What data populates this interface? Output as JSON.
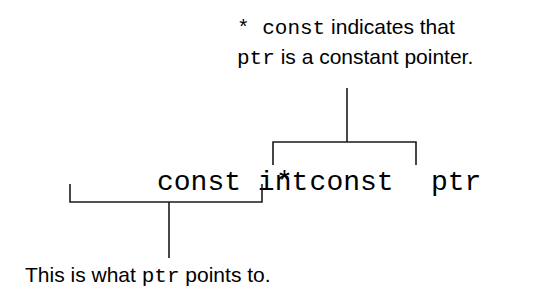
{
  "diagram": {
    "type": "annotated-code",
    "code": {
      "part1": "const int",
      "part2": "* const",
      "part3": "ptr",
      "full": "const int * const ptr"
    },
    "top_annotation": {
      "line1_code": "* const",
      "line1_text": " indicates that",
      "line2_code": "ptr",
      "line2_text": " is a constant pointer.",
      "target": "* const"
    },
    "bottom_annotation": {
      "prefix": "This is what ",
      "code": "ptr",
      "suffix": " points to.",
      "target": "const int"
    },
    "colors": {
      "text": "#1a1a1a",
      "background": "#ffffff"
    }
  }
}
